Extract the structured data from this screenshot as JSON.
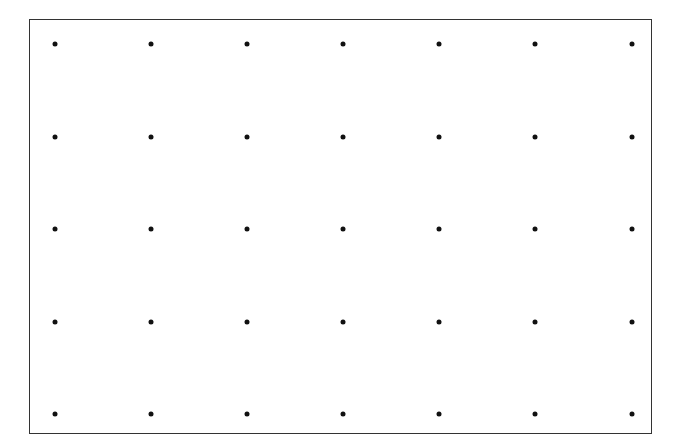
{
  "diagram": {
    "type": "dot-grid",
    "frame": {
      "left": 29,
      "top": 19,
      "right": 653,
      "bottom": 435,
      "border_color": "#333333"
    },
    "dot_color": "#111111",
    "dot_diameter": 5,
    "columns": 7,
    "rows": 5,
    "x_positions": [
      55,
      151,
      247,
      343,
      439,
      535,
      632
    ],
    "y_positions": [
      44,
      137,
      229,
      322,
      414
    ]
  }
}
